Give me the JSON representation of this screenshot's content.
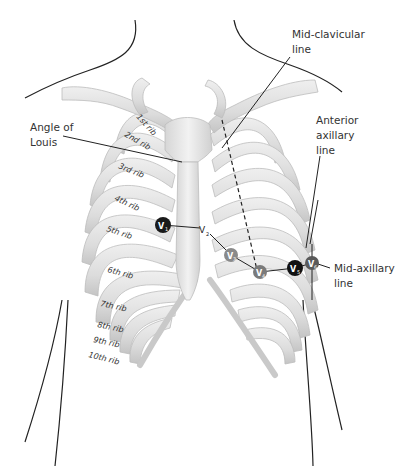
{
  "diagram": {
    "labels": {
      "mid_clavicular_1": "Mid-clavicular",
      "mid_clavicular_2": "line",
      "anterior_axillary_1": "Anterior",
      "anterior_axillary_2": "axillary",
      "anterior_axillary_3": "line",
      "mid_axillary_1": "Mid-axillary",
      "mid_axillary_2": "line",
      "angle_of_louis_1": "Angle of",
      "angle_of_louis_2": "Louis"
    },
    "ribs": [
      "1st rib",
      "2nd rib",
      "3rd rib",
      "4th rib",
      "5th rib",
      "6th rib",
      "7th rib",
      "8th rib",
      "9th rib",
      "10th rib"
    ],
    "electrodes": [
      {
        "id": "V1",
        "sub": "1",
        "x": 163,
        "y": 225,
        "fill": "#1a1a1a"
      },
      {
        "id": "V2",
        "sub": "2",
        "x": 205,
        "y": 229,
        "fill": "none"
      },
      {
        "id": "V3",
        "sub": "3",
        "x": 231,
        "y": 255,
        "fill": "#8a8a8a"
      },
      {
        "id": "V4",
        "sub": "4",
        "x": 260,
        "y": 272,
        "fill": "#7a7a7a"
      },
      {
        "id": "V5",
        "sub": "5",
        "x": 295,
        "y": 268,
        "fill": "#111111"
      },
      {
        "id": "V6",
        "sub": "6",
        "x": 312,
        "y": 263,
        "fill": "#5a5a5a"
      }
    ],
    "colors": {
      "bone": "#e2e2e2",
      "bone_shade": "#c8c8c8",
      "outline": "#222222",
      "text": "#333333"
    }
  }
}
